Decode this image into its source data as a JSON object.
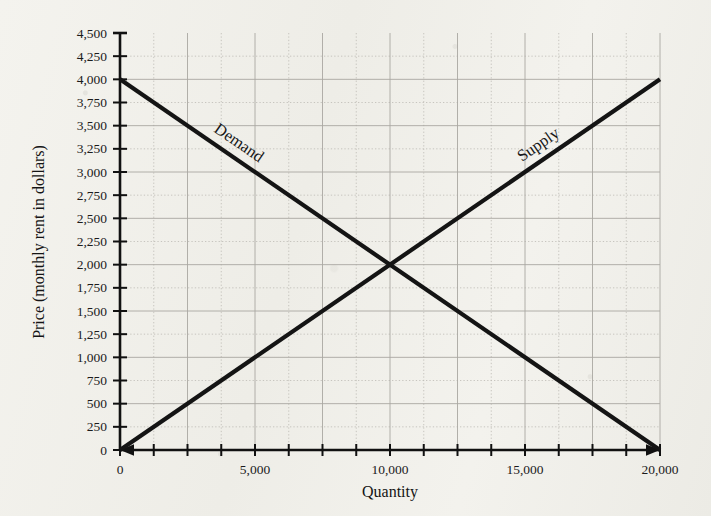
{
  "chart_data": {
    "type": "line",
    "title": "",
    "xlabel": "Quantity",
    "ylabel": "Price (monthly rent in dollars)",
    "xlim": [
      0,
      20000
    ],
    "ylim": [
      0,
      4500
    ],
    "grid": true,
    "legend_position": "inline-curve-labels",
    "x_major_step": 5000,
    "x_minor_step": 1250,
    "y_major_step": 500,
    "y_minor_step": 250,
    "x_tick_labels": [
      "0",
      "5,000",
      "10,000",
      "15,000",
      "20,000"
    ],
    "x_tick_values": [
      0,
      5000,
      10000,
      15000,
      20000
    ],
    "y_tick_labels": [
      "0",
      "250",
      "500",
      "750",
      "1,000",
      "1,250",
      "1,500",
      "1,750",
      "2,000",
      "2,250",
      "2,500",
      "2,750",
      "3,000",
      "3,250",
      "3,500",
      "3,750",
      "4,000",
      "4,250",
      "4,500"
    ],
    "y_tick_values": [
      0,
      250,
      500,
      750,
      1000,
      1250,
      1500,
      1750,
      2000,
      2250,
      2500,
      2750,
      3000,
      3250,
      3500,
      3750,
      4000,
      4250,
      4500
    ],
    "series": [
      {
        "name": "Demand",
        "label": "Demand",
        "x": [
          0,
          20000
        ],
        "values": [
          4000,
          0
        ],
        "color": "#141414"
      },
      {
        "name": "Supply",
        "label": "Supply",
        "x": [
          0,
          20000
        ],
        "values": [
          0,
          4000
        ],
        "color": "#141414"
      }
    ],
    "annotations": [
      {
        "name": "equilibrium",
        "x": 10000,
        "y": 2000,
        "text": ""
      }
    ],
    "colors": {
      "curve": "#141414",
      "axis": "#111111",
      "grid_major": "#a9a7a1",
      "grid_minor": "#bcbab4",
      "background": "#f2f1ec",
      "text": "#1b1b1b"
    }
  }
}
